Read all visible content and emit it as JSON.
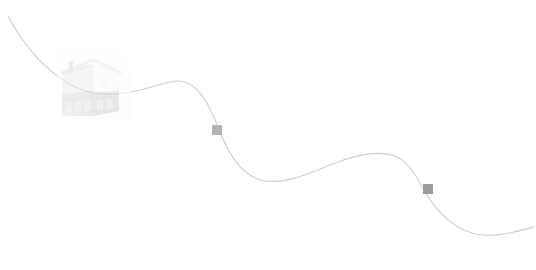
{
  "canvas": {
    "width": 536,
    "height": 270,
    "background_color": "#ffffff",
    "title": "Timeline"
  },
  "path": {
    "name": "timeline-path",
    "stroke_color": "#cfcfcf",
    "stroke_width": 1.1,
    "description": "thin light grey wavy line running from upper-left to lower-right",
    "d": "M 8,16 C 24,46 44,68 66,82 C 88,96 112,96 131,92 C 152,88 168,80 180,81 C 196,82 208,100 220,132 C 232,162 246,178 266,181 C 288,184 312,172 338,162 C 362,153 380,152 392,155 C 406,159 414,172 424,190 C 436,211 452,227 472,233 C 492,239 514,232 534,227"
  },
  "photo": {
    "name": "house-photograph",
    "alt": "faded black and white photograph of a gabled two-storey wooden house with chimney",
    "x": 57,
    "y": 50,
    "width": 74,
    "height": 69,
    "opacity": 0.55,
    "tone_colors": {
      "sky": "#ffffff",
      "siding_light": "#e4e4e4",
      "siding_shadow": "#bdbdbd",
      "wall_dark": "#a9a9a9",
      "roof": "#d2d2d2",
      "chimney": "#b0b0b0",
      "foundation": "#9d9d9d",
      "window": "#c4c4c4"
    }
  },
  "markers": [
    {
      "name": "timeline-marker-1",
      "label": "",
      "x": 212,
      "y": 125,
      "size": 10,
      "color": "#b4b4b4"
    },
    {
      "name": "timeline-marker-2",
      "label": "",
      "x": 423,
      "y": 184,
      "size": 10,
      "color": "#9b9b9b"
    }
  ]
}
